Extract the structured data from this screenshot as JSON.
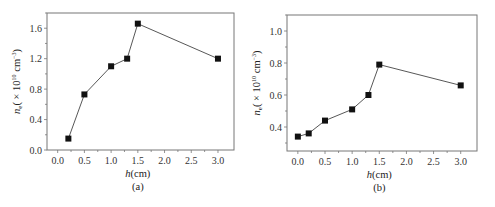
{
  "chart_data": [
    {
      "type": "line",
      "panel": "(a)",
      "title": "",
      "xlabel": "h(cm)",
      "ylabel": "n_e (× 10^10 cm^-3)",
      "x": [
        0.2,
        0.5,
        1.0,
        1.3,
        1.5,
        3.0
      ],
      "series": [
        {
          "name": "n_e",
          "values": [
            0.15,
            0.73,
            1.1,
            1.2,
            1.66,
            1.2
          ]
        }
      ],
      "xticks": [
        "0.0",
        "0.5",
        "1.0",
        "1.5",
        "2.0",
        "2.5",
        "3.0"
      ],
      "yticks": [
        "0.0",
        "0.4",
        "0.8",
        "1.2",
        "1.6"
      ],
      "xlim": [
        -0.2,
        3.3
      ],
      "ylim": [
        0.0,
        1.8
      ],
      "grid": false,
      "legend": null,
      "marker": "square"
    },
    {
      "type": "line",
      "panel": "(b)",
      "title": "",
      "xlabel": "h(cm)",
      "ylabel": "n_e (× 10^10 cm^-3)",
      "x": [
        0.0,
        0.2,
        0.5,
        1.0,
        1.3,
        1.5,
        3.0
      ],
      "series": [
        {
          "name": "n_e",
          "values": [
            0.34,
            0.36,
            0.44,
            0.51,
            0.6,
            0.79,
            0.66
          ]
        }
      ],
      "xticks": [
        "0.0",
        "0.5",
        "1.0",
        "1.5",
        "2.0",
        "2.5",
        "3.0"
      ],
      "yticks": [
        "0.4",
        "0.6",
        "0.8",
        "1.0"
      ],
      "xlim": [
        -0.2,
        3.3
      ],
      "ylim": [
        0.25,
        1.1
      ],
      "grid": false,
      "legend": null,
      "marker": "square"
    }
  ],
  "panels": {
    "a": {
      "caption": "(a)",
      "xlabel_italic": "h",
      "xlabel_unit": "(cm)",
      "ylabel_italic": "n",
      "ylabel_sub": "e",
      "ylabel_rest": "( × 10",
      "ylabel_exp": "10",
      "ylabel_unit": " cm",
      "ylabel_unit_exp": "−3",
      "ylabel_close": ")"
    },
    "b": {
      "caption": "(b)",
      "xlabel_italic": "h",
      "xlabel_unit": "(cm)",
      "ylabel_italic": "n",
      "ylabel_sub": "e",
      "ylabel_rest": "( × 10",
      "ylabel_exp": "10",
      "ylabel_unit": " cm",
      "ylabel_unit_exp": "−3",
      "ylabel_close": ")"
    }
  }
}
